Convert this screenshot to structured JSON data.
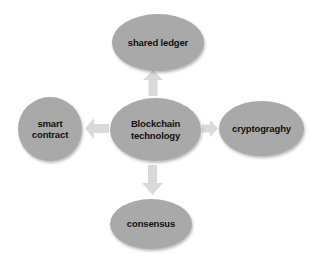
{
  "diagram": {
    "type": "concept-hub-and-spoke",
    "background_color": "#ffffff",
    "node_fill_color": "#a9a9a9",
    "arrow_fill_color": "#d9d9d9",
    "text_color": "#111111",
    "center": {
      "label": "Blockchain\ntechnology",
      "shape": "ellipse"
    },
    "satellites": [
      {
        "id": "shared-ledger",
        "label": "shared ledger",
        "shape": "ellipse",
        "position": "top",
        "arrow": "arrow-up-icon"
      },
      {
        "id": "smart-contract",
        "label": "smart\ncontract",
        "shape": "circle",
        "position": "left",
        "arrow": "arrow-left-icon"
      },
      {
        "id": "cryptograghy",
        "label": "cryptograghy",
        "shape": "ellipse",
        "position": "right",
        "arrow": "arrow-right-icon"
      },
      {
        "id": "consensus",
        "label": "consensus",
        "shape": "ellipse",
        "position": "bottom",
        "arrow": "arrow-down-icon"
      }
    ]
  }
}
